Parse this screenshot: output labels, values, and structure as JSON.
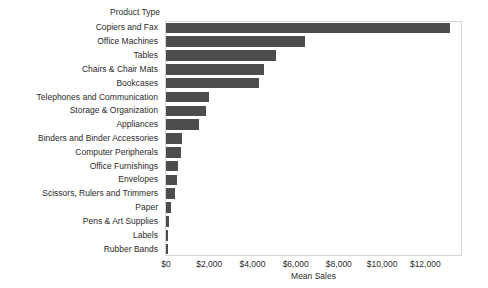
{
  "chart_data": {
    "type": "bar",
    "orientation": "horizontal",
    "title": "",
    "xlabel": "Mean Sales",
    "ylabel": "Product Type",
    "categories": [
      "Copiers and Fax",
      "Office Machines",
      "Tables",
      "Chairs & Chair Mats",
      "Bookcases",
      "Telephones and Communication",
      "Storage & Organization",
      "Appliances",
      "Binders and Binder Accessories",
      "Computer Peripherals",
      "Office Furnishings",
      "Envelopes",
      "Scissors, Rulers and Trimmers",
      "Paper",
      "Pens & Art Supplies",
      "Labels",
      "Rubber Bands"
    ],
    "values": [
      13150,
      6450,
      5080,
      4520,
      4320,
      1980,
      1830,
      1550,
      740,
      700,
      570,
      490,
      420,
      230,
      160,
      85,
      50
    ],
    "xlim": [
      0,
      13700
    ],
    "xticks": [
      0,
      2000,
      4000,
      6000,
      8000,
      10000,
      12000
    ],
    "xticklabels": [
      "$0",
      "$2,000",
      "$4,000",
      "$6,000",
      "$8,000",
      "$10,000",
      "$12,000"
    ],
    "grid": false,
    "legend": null,
    "bar_color": "#4d4d4d",
    "frame_color": "#d6d6d6",
    "background": "#ffffff"
  },
  "axis": {
    "y_field_caption": "Product Type",
    "x_axis_title": "Mean Sales"
  }
}
